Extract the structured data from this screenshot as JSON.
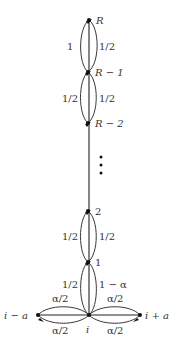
{
  "diagram": {
    "type": "markov-chain-state-graph",
    "nodes": [
      {
        "id": "R",
        "label": "R",
        "x": 89,
        "y": 20
      },
      {
        "id": "R-1",
        "label": "R − 1",
        "x": 88,
        "y": 72
      },
      {
        "id": "R-2",
        "label": "R − 2",
        "x": 88,
        "y": 123
      },
      {
        "id": "2",
        "label": "2",
        "x": 88,
        "y": 211
      },
      {
        "id": "1",
        "label": "1",
        "x": 88,
        "y": 262
      },
      {
        "id": "i",
        "label": "i",
        "x": 89,
        "y": 315
      },
      {
        "id": "i-a",
        "label": "i − a",
        "x": 38,
        "y": 315
      },
      {
        "id": "i+a",
        "label": "i + a",
        "x": 140,
        "y": 315
      }
    ],
    "edges": [
      {
        "from": "R-1",
        "to": "R",
        "label": "1",
        "side": "left"
      },
      {
        "from": "R",
        "to": "R-1",
        "label": "1/2",
        "side": "right"
      },
      {
        "from": "R-2",
        "to": "R-1",
        "label": "1/2",
        "side": "left"
      },
      {
        "from": "R-1",
        "to": "R-2",
        "label": "1/2",
        "side": "right"
      },
      {
        "from": "1",
        "to": "2",
        "label": "1/2",
        "side": "left"
      },
      {
        "from": "2",
        "to": "1",
        "label": "1/2",
        "side": "right"
      },
      {
        "from": "i",
        "to": "1",
        "label": "1/2",
        "side": "left"
      },
      {
        "from": "1",
        "to": "i",
        "label": "1 − α",
        "side": "right"
      },
      {
        "from": "i",
        "to": "i-a",
        "label": "α/2",
        "side": "top-left"
      },
      {
        "from": "i-a",
        "to": "i",
        "label": "α/2",
        "side": "bottom-left"
      },
      {
        "from": "i",
        "to": "i+a",
        "label": "α/2",
        "side": "top-right"
      },
      {
        "from": "i+a",
        "to": "i",
        "label": "α/2",
        "side": "bottom-right"
      }
    ],
    "ellipsis": "⋮",
    "labels": {
      "R": "R",
      "R_minus_1": "R − 1",
      "R_minus_2": "R − 2",
      "two": "2",
      "one": "1",
      "i": "i",
      "i_minus_a": "i − a",
      "i_plus_a": "i + a",
      "edge_R1_R": "1",
      "edge_R_R1": "1/2",
      "edge_R2_R1": "1/2",
      "edge_R1_R2": "1/2",
      "edge_1_2": "1/2",
      "edge_2_1": "1/2",
      "edge_i_1": "1/2",
      "edge_1_i": "1 − α",
      "edge_i_left_top": "α/2",
      "edge_i_left_bottom": "α/2",
      "edge_i_right_top": "α/2",
      "edge_i_right_bottom": "α/2"
    }
  }
}
